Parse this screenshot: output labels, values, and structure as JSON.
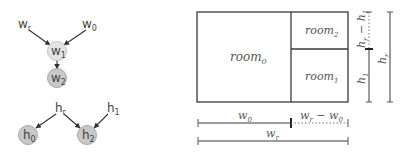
{
  "graph_width": {
    "nodes": [
      {
        "id": "w_r",
        "base": "w",
        "sub": "r",
        "x": 24,
        "y": 24,
        "filled": false
      },
      {
        "id": "w_0",
        "base": "w",
        "sub": "0",
        "x": 90,
        "y": 24,
        "filled": false
      },
      {
        "id": "w_1",
        "base": "w",
        "sub": "1",
        "x": 57,
        "y": 51,
        "filled": true,
        "fill": "#e4e4e4"
      },
      {
        "id": "w_2",
        "base": "w",
        "sub": "2",
        "x": 57,
        "y": 78,
        "filled": true,
        "fill": "#c8c8c8"
      }
    ],
    "edges": [
      [
        "w_r",
        "w_1"
      ],
      [
        "w_0",
        "w_1"
      ],
      [
        "w_1",
        "w_2"
      ]
    ]
  },
  "graph_height": {
    "nodes": [
      {
        "id": "h_r",
        "base": "h",
        "sub": "r",
        "x": 60,
        "y": 108,
        "filled": false
      },
      {
        "id": "h_1",
        "base": "h",
        "sub": "1",
        "x": 112,
        "y": 108,
        "filled": false
      },
      {
        "id": "h_0",
        "base": "h",
        "sub": "0",
        "x": 28,
        "y": 135,
        "filled": true,
        "fill": "#c8c8c8"
      },
      {
        "id": "h_2",
        "base": "h",
        "sub": "2",
        "x": 87,
        "y": 135,
        "filled": true,
        "fill": "#c8c8c8"
      }
    ],
    "edges": [
      [
        "h_r",
        "h_0"
      ],
      [
        "h_r",
        "h_2"
      ],
      [
        "h_1",
        "h_2"
      ]
    ]
  },
  "floorplan": {
    "rooms": [
      {
        "base": "room",
        "sub": "0"
      },
      {
        "base": "room",
        "sub": "1"
      },
      {
        "base": "room",
        "sub": "2"
      }
    ],
    "dimensions": {
      "h1": {
        "base": "h",
        "sub": "1"
      },
      "hr_minus_h1": {
        "a": "h",
        "a_sub": "r",
        "op": "−",
        "b": "h",
        "b_sub": "1"
      },
      "hr": {
        "base": "h",
        "sub": "r"
      },
      "w0": {
        "base": "w",
        "sub": "0"
      },
      "wr_minus_w0": {
        "a": "w",
        "a_sub": "r",
        "op": "−",
        "b": "w",
        "b_sub": "0"
      },
      "wr": {
        "base": "w",
        "sub": "r"
      }
    }
  },
  "colors": {
    "line": "#3a3a3a",
    "node_stroke": "#aaaaaa",
    "text": "#444444"
  }
}
